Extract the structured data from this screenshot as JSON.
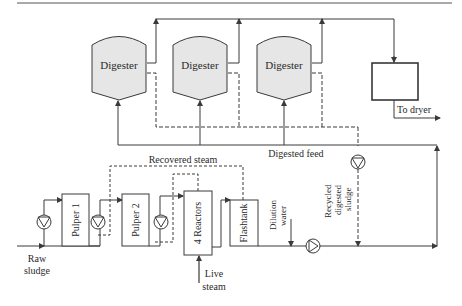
{
  "diagram": {
    "digesters": [
      {
        "label": "Digester"
      },
      {
        "label": "Digester"
      },
      {
        "label": "Digester"
      }
    ],
    "units": {
      "pulper1": "Pulper 1",
      "pulper2": "Pulper 2",
      "reactors": "4 Reactors",
      "flashtank": "Flashtank",
      "storage_tank": ""
    },
    "streams": {
      "recovered_steam": "Recovered steam",
      "digested_feed": "Digested feed",
      "to_dryer": "To dryer",
      "raw_sludge_1": "Raw",
      "raw_sludge_2": "sludge",
      "live_steam_1": "Live",
      "live_steam_2": "steam",
      "dilution_1": "Dilution",
      "dilution_2": "water",
      "recycled_1": "Recycled",
      "recycled_2": "digested",
      "recycled_3": "sludge"
    },
    "colors": {
      "line": "#3a3a3a",
      "digester_fill": "#e6e6e6",
      "box_fill": "#ffffff"
    }
  }
}
